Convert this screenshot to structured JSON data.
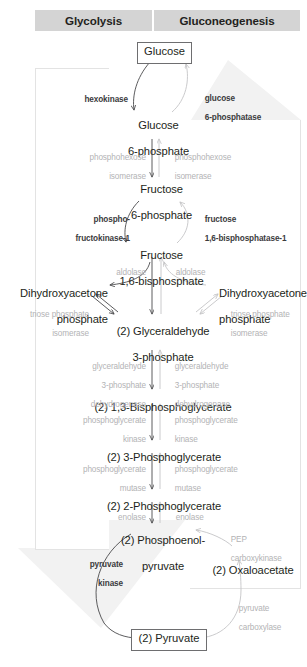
{
  "headers": {
    "left": "Glycolysis",
    "right": "Gluconeogenesis",
    "bar_color": "#d4d4d4"
  },
  "colors": {
    "band": "#f2f2f2",
    "arrow_dark": "#4a4a4c",
    "arrow_light": "#c4c4c6",
    "text_dark": "#231f20",
    "enzyme_dark": "#3b3b3d",
    "enzyme_light": "#b3b3b5",
    "box_border": "#6e6e70",
    "panel_border": "#e3e3e3"
  },
  "metabolites": {
    "glucose": "Glucose",
    "glucose6p_l1": "Glucose",
    "glucose6p_l2": "6-phosphate",
    "fructose6p_l1": "Fructose",
    "fructose6p_l2": "6-phosphate",
    "fructose16bp_l1": "Fructose",
    "fructose16bp_l2": "1,6-bisphosphate",
    "dhap_left_l1": "Dihydroxyacetone",
    "dhap_left_l2": "phosphate",
    "dhap_right_l1": "Dihydroxyacetone",
    "dhap_right_l2": "phosphate",
    "g3p_l1": "(2) Glyceraldehyde",
    "g3p_l2": "3-phosphate",
    "bpg": "(2) 1,3-Bisphosphoglycerate",
    "pg3": "(2) 3-Phosphoglycerate",
    "pg2": "(2) 2-Phosphoglycerate",
    "pep_l1": "(2) Phosphoenol-",
    "pep_l2": "pyruvate",
    "oxaloacetate": "(2) Oxaloacetate",
    "pyruvate": "(2) Pyruvate"
  },
  "enzymes_glycolysis": {
    "hexokinase": "hexokinase",
    "phosphohexose_isomerase_l1": "phosphohexose",
    "phosphohexose_isomerase_l2": "isomerase",
    "pfk1_l1": "phospho-",
    "pfk1_l2": "fructokinase-1",
    "aldolase": "aldolase",
    "tpi_l1": "triose phosphate",
    "tpi_l2": "isomerase",
    "gapdh_l1": "glyceraldehyde",
    "gapdh_l2": "3-phosphate",
    "gapdh_l3": "dehydrogenase",
    "pgk_l1": "phosphoglycerate",
    "pgk_l2": "kinase",
    "pgm_l1": "phosphoglycerate",
    "pgm_l2": "mutase",
    "enolase": "enolase",
    "pyruvate_kinase_l1": "pyruvate",
    "pyruvate_kinase_l2": "kinase"
  },
  "enzymes_gluconeogenesis": {
    "g6pase_l1": "glucose",
    "g6pase_l2": "6-phosphatase",
    "phosphohexose_isomerase_l1": "phosphohexose",
    "phosphohexose_isomerase_l2": "isomerase",
    "fbpase1_l1": "fructose",
    "fbpase1_l2": "1,6-bisphosphatase-1",
    "aldolase": "aldolase",
    "tpi_l1": "triose phosphate",
    "tpi_l2": "isomerase",
    "gapdh_l1": "glyceraldehyde",
    "gapdh_l2": "3-phosphate",
    "gapdh_l3": "dehydrogenase",
    "pgk_l1": "phosphoglycerate",
    "pgk_l2": "kinase",
    "pgm_l1": "phosphoglycerate",
    "pgm_l2": "mutase",
    "enolase": "enolase",
    "pepck_l1": "PEP",
    "pepck_l2": "carboxykinase",
    "pyruvate_carboxylase_l1": "pyruvate",
    "pyruvate_carboxylase_l2": "carboxylase"
  }
}
